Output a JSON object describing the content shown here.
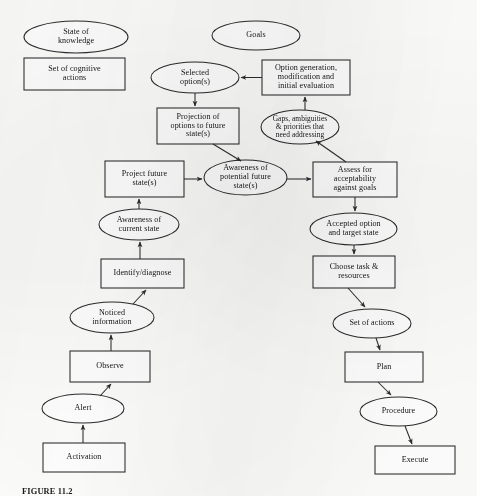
{
  "figure": {
    "caption": "FIGURE 11.2",
    "background_color": "#fdfdfc",
    "ink_color": "#2b2b2b"
  },
  "diagram": {
    "type": "flowchart",
    "legend": {
      "state_ellipse_label": "State of knowledge",
      "process_box_label": "Set of cognitive actions"
    },
    "nodes": [
      {
        "id": "state-of-knowledge",
        "label": "State of\nknowledge",
        "shape": "ellipse",
        "x": 24,
        "y": 21,
        "w": 104,
        "h": 32
      },
      {
        "id": "set-of-cognitive-actions",
        "label": "Set of cognitive\nactions",
        "shape": "box",
        "x": 24,
        "y": 58,
        "w": 101,
        "h": 32
      },
      {
        "id": "goals",
        "label": "Goals",
        "shape": "ellipse",
        "x": 212,
        "y": 21,
        "w": 88,
        "h": 29
      },
      {
        "id": "option-generation",
        "label": "Option generation,\nmodification and\ninitial evaluation",
        "shape": "box",
        "x": 262,
        "y": 60,
        "w": 88,
        "h": 35
      },
      {
        "id": "selected-options",
        "label": "Selected\noption(s)",
        "shape": "ellipse",
        "x": 151,
        "y": 62,
        "w": 88,
        "h": 31
      },
      {
        "id": "projection-of-options",
        "label": "Projection of\noptions to future\nstate(s)",
        "shape": "box",
        "x": 157,
        "y": 108,
        "w": 82,
        "h": 36
      },
      {
        "id": "gaps-ambiguities",
        "label": "Gaps, ambiguities\n& priorities that\nneed addressing",
        "shape": "ellipse",
        "x": 261,
        "y": 110,
        "w": 78,
        "h": 34
      },
      {
        "id": "project-future-states",
        "label": "Project future\nstate(s)",
        "shape": "box",
        "x": 105,
        "y": 161,
        "w": 79,
        "h": 36
      },
      {
        "id": "awareness-potential-future-states",
        "label": "Awareness of\npotential future\nstate(s)",
        "shape": "ellipse",
        "x": 204,
        "y": 160,
        "w": 83,
        "h": 35
      },
      {
        "id": "assess-for-acceptability",
        "label": "Assess for\nacceptability\nagainst goals",
        "shape": "box",
        "x": 313,
        "y": 162,
        "w": 84,
        "h": 35
      },
      {
        "id": "awareness-current-state",
        "label": "Awareness of\ncurrent state",
        "shape": "ellipse",
        "x": 99,
        "y": 209,
        "w": 80,
        "h": 31
      },
      {
        "id": "accepted-option",
        "label": "Accepted option\nand target state",
        "shape": "ellipse",
        "x": 310,
        "y": 213,
        "w": 87,
        "h": 32
      },
      {
        "id": "identify-diagnose",
        "label": "Identify/diagnose",
        "shape": "box",
        "x": 101,
        "y": 259,
        "w": 83,
        "h": 29
      },
      {
        "id": "choose-task-resources",
        "label": "Choose task &\nresources",
        "shape": "box",
        "x": 313,
        "y": 256,
        "w": 82,
        "h": 32
      },
      {
        "id": "noticed-information",
        "label": "Noticed\ninformation",
        "shape": "ellipse",
        "x": 70,
        "y": 302,
        "w": 84,
        "h": 31
      },
      {
        "id": "set-of-actions",
        "label": "Set of actions",
        "shape": "ellipse",
        "x": 333,
        "y": 309,
        "w": 78,
        "h": 29
      },
      {
        "id": "observe",
        "label": "Observe",
        "shape": "box",
        "x": 70,
        "y": 351,
        "w": 80,
        "h": 31
      },
      {
        "id": "plan",
        "label": "Plan",
        "shape": "box",
        "x": 345,
        "y": 352,
        "w": 78,
        "h": 30
      },
      {
        "id": "alert",
        "label": "Alert",
        "shape": "ellipse",
        "x": 42,
        "y": 394,
        "w": 82,
        "h": 29
      },
      {
        "id": "procedure",
        "label": "Procedure",
        "shape": "ellipse",
        "x": 360,
        "y": 397,
        "w": 77,
        "h": 29
      },
      {
        "id": "activation",
        "label": "Activation",
        "shape": "box",
        "x": 43,
        "y": 443,
        "w": 82,
        "h": 29
      },
      {
        "id": "execute",
        "label": "Execute",
        "shape": "box",
        "x": 375,
        "y": 446,
        "w": 80,
        "h": 28
      }
    ],
    "edges": [
      {
        "from": "option-generation",
        "to": "selected-options"
      },
      {
        "from": "selected-options",
        "to": "projection-of-options"
      },
      {
        "from": "projection-of-options",
        "to": "awareness-potential-future-states"
      },
      {
        "from": "project-future-states",
        "to": "awareness-potential-future-states"
      },
      {
        "from": "awareness-potential-future-states",
        "to": "assess-for-acceptability"
      },
      {
        "from": "assess-for-acceptability",
        "to": "gaps-ambiguities"
      },
      {
        "from": "gaps-ambiguities",
        "to": "option-generation"
      },
      {
        "from": "awareness-current-state",
        "to": "project-future-states"
      },
      {
        "from": "assess-for-acceptability",
        "to": "accepted-option"
      },
      {
        "from": "accepted-option",
        "to": "choose-task-resources"
      },
      {
        "from": "choose-task-resources",
        "to": "set-of-actions"
      },
      {
        "from": "set-of-actions",
        "to": "plan"
      },
      {
        "from": "plan",
        "to": "procedure"
      },
      {
        "from": "procedure",
        "to": "execute"
      },
      {
        "from": "identify-diagnose",
        "to": "awareness-current-state"
      },
      {
        "from": "noticed-information",
        "to": "identify-diagnose"
      },
      {
        "from": "observe",
        "to": "noticed-information"
      },
      {
        "from": "alert",
        "to": "observe"
      },
      {
        "from": "activation",
        "to": "alert"
      }
    ]
  }
}
